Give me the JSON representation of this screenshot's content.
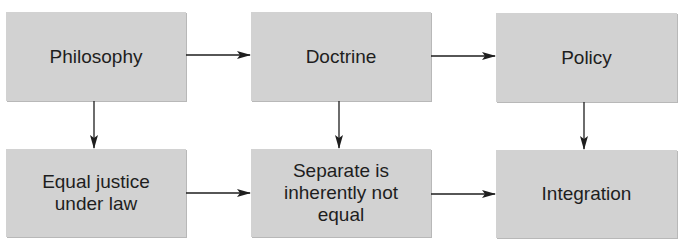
{
  "diagram": {
    "type": "flowchart",
    "nodes": [
      {
        "id": "philosophy",
        "label": "Philosophy"
      },
      {
        "id": "doctrine",
        "label": "Doctrine"
      },
      {
        "id": "policy",
        "label": "Policy"
      },
      {
        "id": "equal_justice",
        "label": "Equal justice under law"
      },
      {
        "id": "separate",
        "label": "Separate is inherently not equal"
      },
      {
        "id": "integration",
        "label": "Integration"
      }
    ],
    "edges": [
      {
        "from": "philosophy",
        "to": "doctrine"
      },
      {
        "from": "doctrine",
        "to": "policy"
      },
      {
        "from": "philosophy",
        "to": "equal_justice"
      },
      {
        "from": "doctrine",
        "to": "separate"
      },
      {
        "from": "policy",
        "to": "integration"
      },
      {
        "from": "equal_justice",
        "to": "separate"
      },
      {
        "from": "separate",
        "to": "integration"
      }
    ]
  },
  "labels": {
    "philosophy": "Philosophy",
    "doctrine": "Doctrine",
    "policy": "Policy",
    "equal_justice_1": "Equal justice",
    "equal_justice_2": "under law",
    "separate_1": "Separate is",
    "separate_2": "inherently not",
    "separate_3": "equal",
    "integration": "Integration"
  },
  "colors": {
    "box_fill": "#d2d2d2",
    "arrow": "#1e1e1e",
    "text": "#1e1e1e"
  }
}
